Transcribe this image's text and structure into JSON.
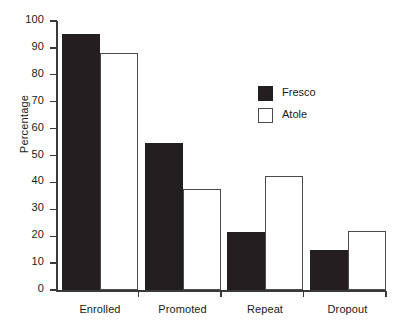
{
  "chart_data": {
    "type": "bar",
    "title": "",
    "subtitle": "",
    "xlabel": "",
    "ylabel": "Percentage",
    "ylim": [
      0,
      100
    ],
    "ytick_step": 10,
    "yticks": [
      0,
      10,
      20,
      30,
      40,
      50,
      60,
      70,
      80,
      90,
      100
    ],
    "ytick_labels": [
      "0",
      "10",
      "20",
      "30",
      "40",
      "50",
      "60",
      "70",
      "80",
      "90",
      "100"
    ],
    "categories": [
      "Enrolled",
      "Promoted",
      "Repeat",
      "Dropout"
    ],
    "grid": false,
    "legend_position": "upper right",
    "series": [
      {
        "name": "Fresco",
        "color": "#231f20",
        "style": "filled",
        "values": [
          95,
          54.5,
          21.5,
          15
        ]
      },
      {
        "name": "Atole",
        "color": "#ffffff",
        "edge_color": "#4a4a4a",
        "style": "outlined",
        "values": [
          88,
          37.5,
          42.5,
          22
        ]
      }
    ]
  },
  "legend": {
    "items": [
      {
        "label": "Fresco",
        "swatch": "filled-black-square"
      },
      {
        "label": "Atole",
        "swatch": "outlined-white-square"
      }
    ]
  },
  "axes": {
    "y_label": "Percentage"
  }
}
